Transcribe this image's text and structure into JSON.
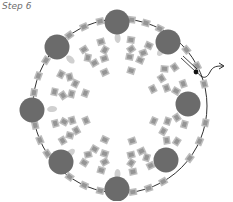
{
  "diagram": {
    "step_label": "Step 6",
    "colors": {
      "large_bead": "#6b6b6b",
      "cube_bead_fill": "#b9b9b9",
      "cube_bead_inner": "#8f8f8f",
      "seed_bead": "#cfcfcf",
      "thread": "#1a1a1a"
    },
    "ring": {
      "cx": 120,
      "cy": 106,
      "r": 87
    },
    "large_beads": [
      {
        "cx": 117,
        "cy": 22
      },
      {
        "cx": 168,
        "cy": 42
      },
      {
        "cx": 188,
        "cy": 104
      },
      {
        "cx": 166,
        "cy": 160
      },
      {
        "cx": 117,
        "cy": 189
      },
      {
        "cx": 61,
        "cy": 162
      },
      {
        "cx": 32,
        "cy": 110
      },
      {
        "cx": 57,
        "cy": 47
      }
    ],
    "thread_end": {
      "knot_x": 196,
      "knot_y": 72,
      "arrow_tip_x": 223,
      "arrow_tip_y": 66
    }
  }
}
